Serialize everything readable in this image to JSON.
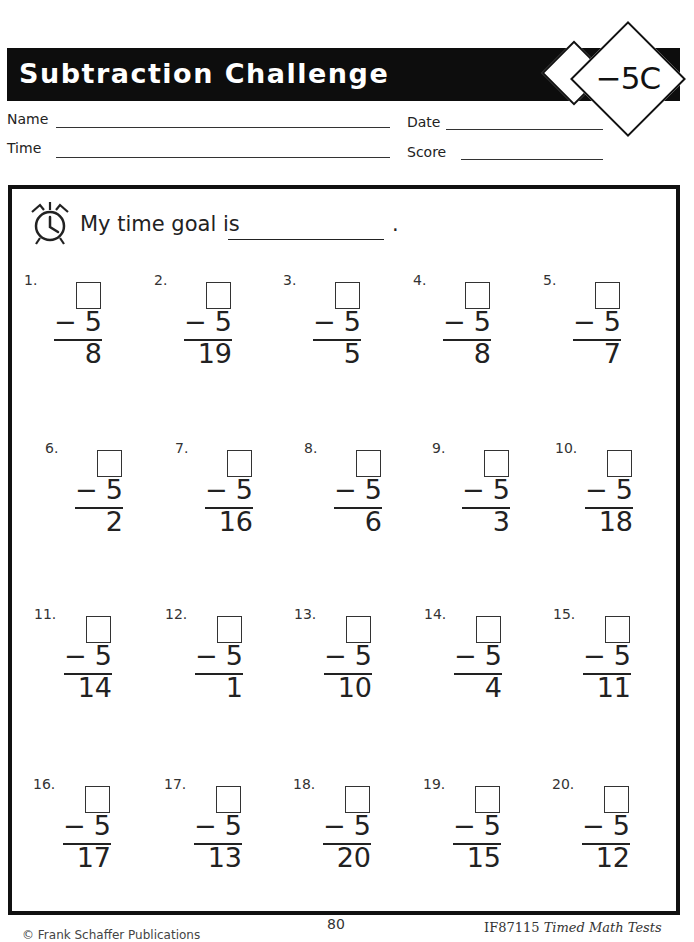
{
  "header": {
    "title": "Subtraction Challenge",
    "badge": "−5C"
  },
  "fields": {
    "name_label": "Name",
    "date_label": "Date",
    "time_label": "Time",
    "score_label": "Score"
  },
  "goal": {
    "icon": "alarm-clock-icon",
    "text": "My time goal is",
    "period": "."
  },
  "problems": [
    {
      "num": "1.",
      "subtrahend": "5",
      "result": "8"
    },
    {
      "num": "2.",
      "subtrahend": "5",
      "result": "19"
    },
    {
      "num": "3.",
      "subtrahend": "5",
      "result": "5"
    },
    {
      "num": "4.",
      "subtrahend": "5",
      "result": "8"
    },
    {
      "num": "5.",
      "subtrahend": "5",
      "result": "7"
    },
    {
      "num": "6.",
      "subtrahend": "5",
      "result": "2"
    },
    {
      "num": "7.",
      "subtrahend": "5",
      "result": "16"
    },
    {
      "num": "8.",
      "subtrahend": "5",
      "result": "6"
    },
    {
      "num": "9.",
      "subtrahend": "5",
      "result": "3"
    },
    {
      "num": "10.",
      "subtrahend": "5",
      "result": "18"
    },
    {
      "num": "11.",
      "subtrahend": "5",
      "result": "14"
    },
    {
      "num": "12.",
      "subtrahend": "5",
      "result": "1"
    },
    {
      "num": "13.",
      "subtrahend": "5",
      "result": "10"
    },
    {
      "num": "14.",
      "subtrahend": "5",
      "result": "4"
    },
    {
      "num": "15.",
      "subtrahend": "5",
      "result": "11"
    },
    {
      "num": "16.",
      "subtrahend": "5",
      "result": "17"
    },
    {
      "num": "17.",
      "subtrahend": "5",
      "result": "13"
    },
    {
      "num": "18.",
      "subtrahend": "5",
      "result": "20"
    },
    {
      "num": "19.",
      "subtrahend": "5",
      "result": "15"
    },
    {
      "num": "20.",
      "subtrahend": "5",
      "result": "12"
    }
  ],
  "minus_sign": "−",
  "footer": {
    "copyright": "© Frank Schaffer Publications",
    "page_number": "80",
    "product_code": "IF87115",
    "book_title": "Timed Math Tests"
  }
}
